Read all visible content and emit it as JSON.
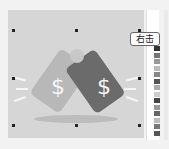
{
  "tooltip": {
    "label": "右击"
  },
  "illustration": {
    "icon": "price-tags-dollar-icon",
    "tag_symbol": "$"
  },
  "swatches": [
    "#333333",
    "#777777",
    "#999999",
    "#bbbbbb",
    "#888888",
    "#555555",
    "#aaaaaa",
    "#cccccc",
    "#444444",
    "#999999",
    "#666666",
    "#bbbbbb",
    "#777777",
    "#555555"
  ]
}
